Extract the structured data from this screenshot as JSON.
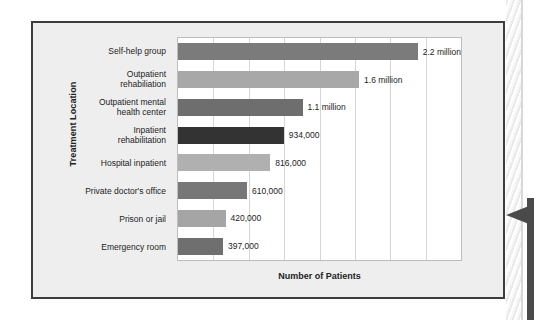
{
  "figure": {
    "frame_border_color": "#3c3c3c",
    "panel_bg": "#eeeeee",
    "plot_bg": "#ffffff",
    "grid_color": "#d6d6d6"
  },
  "decor": {
    "spine_name": "page-edge-hatching",
    "arrow_name": "callout-arrow",
    "arrow_color": "#4a4a4a"
  },
  "chart_data": {
    "type": "bar",
    "orientation": "horizontal",
    "title": "",
    "xlabel": "Number of Patients",
    "ylabel": "Treatment Location",
    "xlim": [
      0,
      2500000
    ],
    "grid": true,
    "grid_axis": "x",
    "gridline_values": [
      312500,
      625000,
      937500,
      1250000,
      1562500,
      1875000,
      2187500
    ],
    "legend": null,
    "categories": [
      "Self-help group",
      "Outpatient rehabiliation",
      "Outpatient mental health center",
      "Inpatient rehabilitation",
      "Hospital inpatient",
      "Private doctor's office",
      "Prison or jail",
      "Emergency room"
    ],
    "values": [
      2200000,
      1600000,
      1100000,
      934000,
      816000,
      610000,
      420000,
      397000
    ],
    "data_labels": [
      "2.2 million",
      "1.6 million",
      "1.1 million",
      "934,000",
      "816,000",
      "610,000",
      "420,000",
      "397,000"
    ],
    "bar_colors": [
      "#7b7b7b",
      "#a8a8a8",
      "#6e6e6e",
      "#333333",
      "#b0b0b0",
      "#777777",
      "#a5a5a5",
      "#6f6f6f"
    ],
    "category_lines": [
      [
        "Self-help group"
      ],
      [
        "Outpatient",
        "rehabiliation"
      ],
      [
        "Outpatient mental",
        "health center"
      ],
      [
        "Inpatient",
        "rehabilitation"
      ],
      [
        "Hospital inpatient"
      ],
      [
        "Private doctor's office"
      ],
      [
        "Prison or jail"
      ],
      [
        "Emergency room"
      ]
    ]
  }
}
